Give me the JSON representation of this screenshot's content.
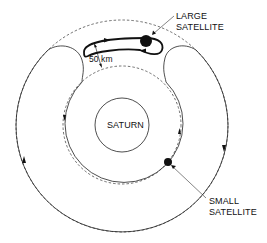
{
  "diagram": {
    "type": "orbital-schematic",
    "colors": {
      "line": "#222222",
      "background": "#ffffff"
    },
    "planet": {
      "label": "SATURN"
    },
    "large_satellite": {
      "label_line1": "LARGE",
      "label_line2": "SATELLITE"
    },
    "small_satellite": {
      "label_line1": "SMALL",
      "label_line2": "SATELLITE"
    },
    "separation": {
      "label": "50 km"
    }
  }
}
